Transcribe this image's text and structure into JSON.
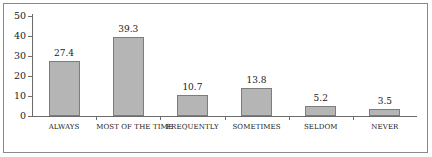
{
  "chart_data": {
    "type": "bar",
    "title": "",
    "xlabel": "",
    "ylabel": "",
    "ylim": [
      0,
      50
    ],
    "yticks": [
      0,
      10,
      20,
      30,
      40,
      50
    ],
    "grid": false,
    "legend": "none",
    "categories": [
      "ALWAYS",
      "MOST OF THE TIME",
      "FREQUENTLY",
      "SOMETIMES",
      "SELDOM",
      "NEVER"
    ],
    "values": [
      27.4,
      39.3,
      10.7,
      13.8,
      5.2,
      3.5
    ],
    "value_labels": [
      "27.4",
      "39.3",
      "10.7",
      "13.8",
      "5.2",
      "3.5"
    ],
    "tick_labels": [
      "50",
      "40",
      "30",
      "20",
      "10",
      "0"
    ],
    "colors": {
      "bar_fill": "#b5b5b5",
      "bar_border": "#7d7d7d",
      "axis": "#6b6b6b",
      "frame": "#8a8a8a",
      "text": "#1a1a1a",
      "background": "#ffffff"
    }
  }
}
